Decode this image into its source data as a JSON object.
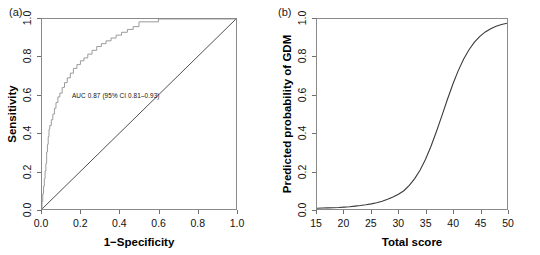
{
  "figure": {
    "panels": [
      {
        "label": "(a)",
        "annotation": "AUC 0.87 (95% CI 0.81–0.93)"
      },
      {
        "label": "(b)"
      }
    ]
  },
  "chart_data": [
    {
      "type": "line",
      "title": "",
      "panel": "(a)",
      "xlabel": "1−Specificity",
      "ylabel": "Sensitivity",
      "xlim": [
        0,
        1
      ],
      "ylim": [
        0,
        1
      ],
      "xticks": [
        "0.0",
        "0.2",
        "0.4",
        "0.6",
        "0.8",
        "1.0"
      ],
      "xtick_values": [
        0.0,
        0.2,
        0.4,
        0.6,
        0.8,
        1.0
      ],
      "yticks": [
        "0.0",
        "0.2",
        "0.4",
        "0.6",
        "0.8",
        "1.0"
      ],
      "ytick_values": [
        0.0,
        0.2,
        0.4,
        0.6,
        0.8,
        1.0
      ],
      "grid": false,
      "legend": "none",
      "annotations": [
        {
          "text": "AUC 0.87 (95% CI 0.81–0.93)",
          "x": 0.22,
          "y": 0.6
        }
      ],
      "series": [
        {
          "name": "ROC curve",
          "style": "step",
          "color": "#9a9a9a",
          "x": [
            0.0,
            0.0,
            0.004,
            0.004,
            0.008,
            0.008,
            0.012,
            0.012,
            0.016,
            0.016,
            0.02,
            0.02,
            0.024,
            0.024,
            0.028,
            0.028,
            0.032,
            0.032,
            0.036,
            0.036,
            0.04,
            0.04,
            0.048,
            0.048,
            0.056,
            0.056,
            0.064,
            0.064,
            0.072,
            0.072,
            0.082,
            0.082,
            0.092,
            0.092,
            0.104,
            0.104,
            0.116,
            0.116,
            0.13,
            0.13,
            0.146,
            0.146,
            0.162,
            0.162,
            0.18,
            0.18,
            0.198,
            0.198,
            0.216,
            0.216,
            0.236,
            0.236,
            0.258,
            0.258,
            0.282,
            0.282,
            0.306,
            0.306,
            0.33,
            0.33,
            0.356,
            0.356,
            0.382,
            0.382,
            0.41,
            0.41,
            0.44,
            0.44,
            0.47,
            0.47,
            0.5,
            0.5,
            0.6,
            0.6,
            1.0
          ],
          "y": [
            0.0,
            0.04,
            0.04,
            0.08,
            0.08,
            0.12,
            0.12,
            0.16,
            0.16,
            0.2,
            0.2,
            0.24,
            0.24,
            0.3,
            0.3,
            0.34,
            0.34,
            0.38,
            0.38,
            0.42,
            0.42,
            0.44,
            0.44,
            0.47,
            0.47,
            0.5,
            0.5,
            0.53,
            0.53,
            0.56,
            0.56,
            0.59,
            0.59,
            0.61,
            0.61,
            0.64,
            0.64,
            0.665,
            0.665,
            0.69,
            0.69,
            0.715,
            0.715,
            0.74,
            0.74,
            0.76,
            0.76,
            0.78,
            0.78,
            0.795,
            0.795,
            0.815,
            0.815,
            0.835,
            0.835,
            0.855,
            0.855,
            0.87,
            0.87,
            0.885,
            0.885,
            0.9,
            0.9,
            0.915,
            0.915,
            0.93,
            0.93,
            0.945,
            0.945,
            0.96,
            0.96,
            0.985,
            0.985,
            1.0,
            1.0
          ]
        },
        {
          "name": "Reference diagonal",
          "style": "line",
          "color": "#3a3a3a",
          "x": [
            0,
            1
          ],
          "y": [
            0,
            1
          ]
        }
      ]
    },
    {
      "type": "line",
      "title": "",
      "panel": "(b)",
      "xlabel": "Total  score",
      "ylabel": "Predicted probability of GDM",
      "xlim": [
        15,
        50
      ],
      "ylim": [
        0,
        1
      ],
      "xticks": [
        "15",
        "20",
        "25",
        "30",
        "35",
        "40",
        "45",
        "50"
      ],
      "xtick_values": [
        15,
        20,
        25,
        30,
        35,
        40,
        45,
        50
      ],
      "yticks": [
        "0.0",
        "0.2",
        "0.4",
        "0.6",
        "0.8",
        "1.0"
      ],
      "ytick_values": [
        0.0,
        0.2,
        0.4,
        0.6,
        0.8,
        1.0
      ],
      "grid": false,
      "legend": "none",
      "series": [
        {
          "name": "Predicted probability",
          "style": "line",
          "color": "#3a3a3a",
          "x": [
            15,
            16,
            17,
            18,
            19,
            20,
            21,
            22,
            23,
            24,
            25,
            26,
            27,
            28,
            29,
            30,
            31,
            32,
            33,
            34,
            35,
            36,
            37,
            38,
            39,
            40,
            41,
            42,
            43,
            44,
            45,
            46,
            47,
            48,
            49,
            50
          ],
          "y": [
            0.004,
            0.005,
            0.006,
            0.007,
            0.008,
            0.01,
            0.012,
            0.015,
            0.018,
            0.022,
            0.027,
            0.033,
            0.041,
            0.051,
            0.063,
            0.078,
            0.096,
            0.124,
            0.16,
            0.205,
            0.262,
            0.33,
            0.408,
            0.49,
            0.575,
            0.655,
            0.727,
            0.788,
            0.838,
            0.878,
            0.909,
            0.932,
            0.949,
            0.962,
            0.971,
            0.978
          ]
        }
      ]
    }
  ]
}
